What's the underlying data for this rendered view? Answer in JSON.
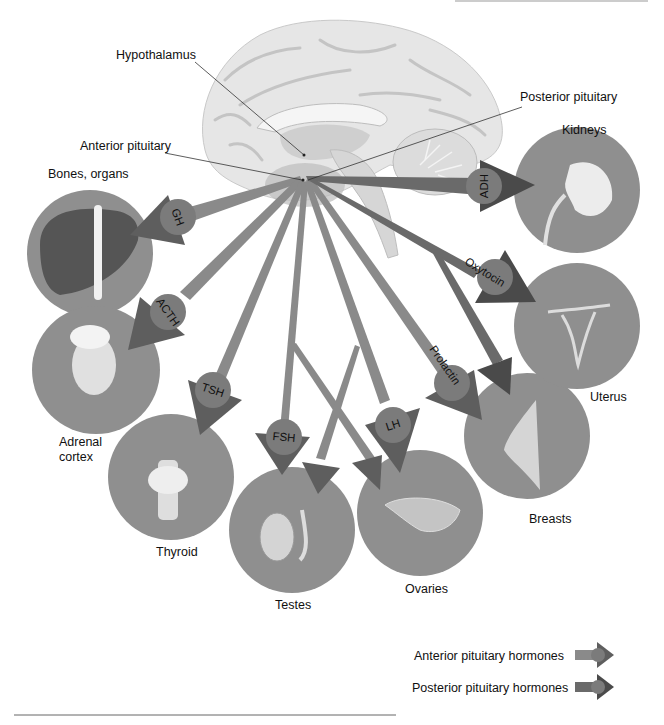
{
  "diagram": {
    "center": {
      "x": 305,
      "y": 178
    },
    "structure_labels": {
      "hypothalamus": "Hypothalamus",
      "anterior_pituitary": "Anterior pituitary",
      "posterior_pituitary": "Posterior pituitary"
    },
    "targets": [
      {
        "id": "bones",
        "label": "Bones, organs",
        "hormone": "GH",
        "type": "anterior"
      },
      {
        "id": "adrenal",
        "label_line1": "Adrenal",
        "label_line2": "cortex",
        "hormone": "ACTH",
        "type": "anterior"
      },
      {
        "id": "thyroid",
        "label": "Thyroid",
        "hormone": "TSH",
        "type": "anterior"
      },
      {
        "id": "testes",
        "label": "Testes",
        "hormone": "FSH",
        "type": "anterior"
      },
      {
        "id": "ovaries",
        "label": "Ovaries",
        "hormone": "LH",
        "type": "anterior"
      },
      {
        "id": "breasts",
        "label": "Breasts",
        "hormone": "Prolactin",
        "type": "anterior"
      },
      {
        "id": "uterus",
        "label": "Uterus",
        "hormone": "Oxytocin",
        "type": "posterior"
      },
      {
        "id": "kidneys",
        "label": "Kidneys",
        "hormone": "ADH",
        "type": "posterior"
      }
    ],
    "legend": {
      "anterior": "Anterior pituitary hormones",
      "posterior": "Posterior pituitary hormones"
    },
    "colors": {
      "circle": "#8f8f8f",
      "anterior_arrow": "#8a8a8a",
      "anterior_head": "#5e5e5e",
      "posterior_arrow": "#6a6a6a",
      "posterior_head": "#4a4a4a",
      "brain": "#e4e4e4"
    }
  }
}
